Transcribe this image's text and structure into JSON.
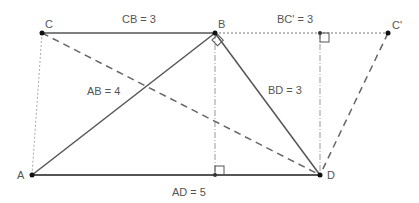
{
  "diagram": {
    "type": "geometry",
    "points": {
      "A": {
        "label": "A",
        "x": 32,
        "y": 175
      },
      "B": {
        "label": "B",
        "x": 215,
        "y": 33
      },
      "C": {
        "label": "C",
        "x": 42,
        "y": 33
      },
      "C_prime": {
        "label": "C'",
        "x": 388,
        "y": 33
      },
      "D": {
        "label": "D",
        "x": 320,
        "y": 175
      },
      "H_AD": {
        "x": 215,
        "y": 175
      },
      "H_BC": {
        "x": 320,
        "y": 33
      }
    },
    "labels": {
      "cb": "CB = 3",
      "bc_prime": "BC' = 3",
      "ab": "AB = 4",
      "bd": "BD = 3",
      "ad": "AD = 5"
    },
    "segments": [
      {
        "from": "C",
        "to": "B",
        "style": "solid"
      },
      {
        "from": "A",
        "to": "B",
        "style": "solid"
      },
      {
        "from": "B",
        "to": "D",
        "style": "solid"
      },
      {
        "from": "A",
        "to": "D",
        "style": "solid"
      },
      {
        "from": "C",
        "to": "D",
        "style": "dashed"
      },
      {
        "from": "C_prime",
        "to": "D",
        "style": "dashed"
      },
      {
        "from": "B",
        "to": "C_prime",
        "style": "dotted"
      },
      {
        "from": "C",
        "to": "A",
        "style": "dotted"
      },
      {
        "from": "B",
        "to": "H_AD",
        "style": "dash-dot"
      },
      {
        "from": "H_BC",
        "to": "D",
        "style": "dash-dot"
      }
    ],
    "colors": {
      "line": "#555555",
      "point": "#111111",
      "label": "#555555"
    }
  }
}
